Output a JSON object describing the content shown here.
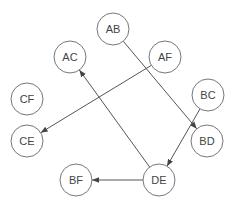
{
  "diagram": {
    "type": "directed-graph",
    "node_radius": 16,
    "nodes": [
      {
        "id": "AB",
        "label": "AB",
        "x": 113,
        "y": 29
      },
      {
        "id": "AC",
        "label": "AC",
        "x": 70,
        "y": 57
      },
      {
        "id": "AF",
        "label": "AF",
        "x": 165,
        "y": 57
      },
      {
        "id": "CF",
        "label": "CF",
        "x": 27,
        "y": 99
      },
      {
        "id": "CE",
        "label": "CE",
        "x": 27,
        "y": 141
      },
      {
        "id": "BC",
        "label": "BC",
        "x": 208,
        "y": 95
      },
      {
        "id": "BD",
        "label": "BD",
        "x": 207,
        "y": 141
      },
      {
        "id": "BF",
        "label": "BF",
        "x": 76,
        "y": 180
      },
      {
        "id": "DE",
        "label": "DE",
        "x": 159,
        "y": 180
      }
    ],
    "edges": [
      {
        "from": "AB",
        "to": "BD"
      },
      {
        "from": "AF",
        "to": "CE"
      },
      {
        "from": "DE",
        "to": "AC"
      },
      {
        "from": "BC",
        "to": "DE"
      },
      {
        "from": "DE",
        "to": "BF"
      }
    ],
    "colors": {
      "stroke": "#777777",
      "edge": "#555555",
      "text": "#444444"
    }
  }
}
